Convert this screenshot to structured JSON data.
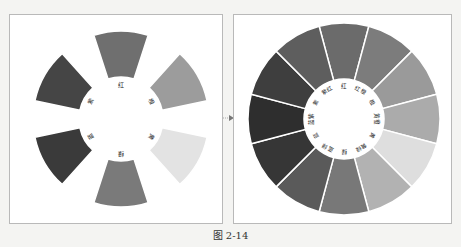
{
  "figure": {
    "caption": "图 2-14"
  },
  "left_wheel": {
    "title": "六色相环",
    "segments": [
      {
        "label": "红",
        "color": "#6f6f6f",
        "angle": 0
      },
      {
        "label": "橙",
        "color": "#9c9c9c",
        "angle": 60
      },
      {
        "label": "黄",
        "color": "#e3e3e3",
        "angle": 120
      },
      {
        "label": "绿",
        "color": "#7a7a7a",
        "angle": 180
      },
      {
        "label": "蓝",
        "color": "#3a3a3a",
        "angle": 240
      },
      {
        "label": "紫",
        "color": "#454545",
        "angle": 300
      }
    ]
  },
  "right_wheel": {
    "title": "十二色相环",
    "segments": [
      {
        "label": "红",
        "color": "#6b6b6b",
        "angle": 0
      },
      {
        "label": "红橙",
        "color": "#7c7c7c",
        "angle": 30
      },
      {
        "label": "橙",
        "color": "#9a9a9a",
        "angle": 60
      },
      {
        "label": "黄橙",
        "color": "#ababab",
        "angle": 90
      },
      {
        "label": "黄",
        "color": "#dedede",
        "angle": 120
      },
      {
        "label": "黄绿",
        "color": "#b2b2b2",
        "angle": 150
      },
      {
        "label": "绿",
        "color": "#787878",
        "angle": 180
      },
      {
        "label": "蓝绿",
        "color": "#5a5a5a",
        "angle": 210
      },
      {
        "label": "蓝",
        "color": "#363636",
        "angle": 240
      },
      {
        "label": "蓝紫",
        "color": "#2e2e2e",
        "angle": 270
      },
      {
        "label": "紫",
        "color": "#3e3e3e",
        "angle": 300
      },
      {
        "label": "紫红",
        "color": "#5e5e5e",
        "angle": 330
      }
    ]
  },
  "arrow": {
    "icon": "arrow-right-icon"
  }
}
